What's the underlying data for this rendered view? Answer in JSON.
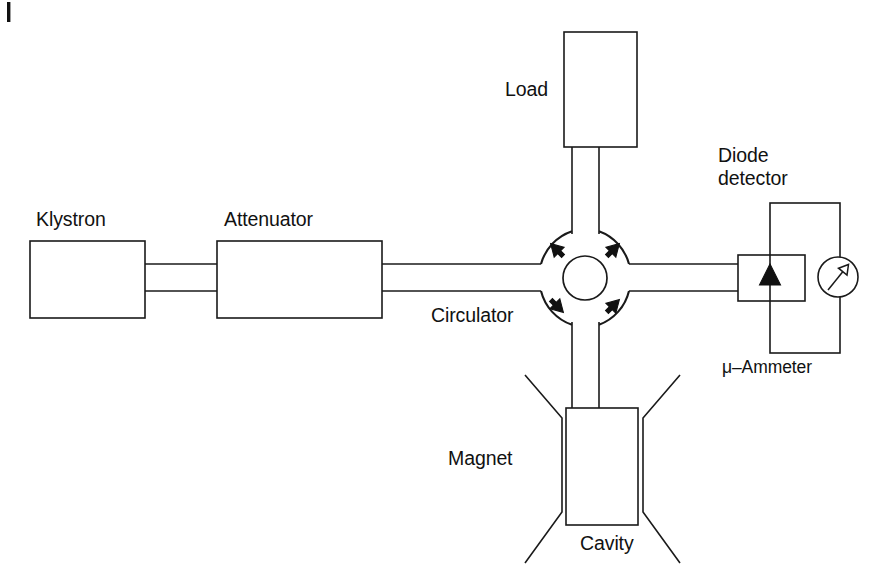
{
  "figure": {
    "domain": "Diagram",
    "background_color": "#ffffff",
    "line_color": "#1a1a1a",
    "width": 892,
    "height": 585
  },
  "labels": {
    "klystron": "Klystron",
    "attenuator": "Attenuator",
    "load": "Load",
    "circulator": "Circulator",
    "diode_detector_line1": "Diode",
    "diode_detector_line2": "detector",
    "micro_ammeter": "μ–Ammeter",
    "magnet": "Magnet",
    "cavity": "Cavity"
  },
  "components": [
    {
      "id": "klystron",
      "name": "Klystron",
      "shape": "rectangle",
      "x": 30,
      "y": 241,
      "width": 115,
      "height": 77,
      "label_position": "above"
    },
    {
      "id": "attenuator",
      "name": "Attenuator",
      "shape": "rectangle",
      "x": 217,
      "y": 241,
      "width": 165,
      "height": 77,
      "label_position": "above"
    },
    {
      "id": "load",
      "name": "Load",
      "shape": "rectangle",
      "x": 564,
      "y": 32,
      "width": 73,
      "height": 115,
      "label_position": "left"
    },
    {
      "id": "circulator",
      "name": "Circulator",
      "shape": "circulator",
      "center_x": 585,
      "center_y": 278,
      "outer_radius": 48,
      "inner_radius": 22,
      "port_count": 4,
      "rotation_sense": "counter-clockwise",
      "label_position": "lower-left"
    },
    {
      "id": "diode-detector",
      "name": "Diode detector",
      "shape": "rectangle-with-diode-triangle",
      "x": 738,
      "y": 255,
      "width": 67,
      "height": 46,
      "label_position": "above"
    },
    {
      "id": "micro-ammeter",
      "name": "μ–Ammeter",
      "shape": "circle-with-needle",
      "center_x": 838,
      "center_y": 277,
      "radius": 20,
      "label_position": "below"
    },
    {
      "id": "cavity",
      "name": "Cavity",
      "shape": "rectangle",
      "x": 566,
      "y": 408,
      "width": 72,
      "height": 117,
      "label_position": "below"
    },
    {
      "id": "magnet",
      "name": "Magnet",
      "shape": "pole-pieces-pair",
      "left_pole_x": 525,
      "right_pole_x": 680,
      "top_y": 375,
      "bottom_y": 563,
      "label_position": "left"
    }
  ],
  "connections": [
    {
      "id": "klystron-attenuator",
      "from": "klystron",
      "to": "attenuator",
      "type": "waveguide",
      "orientation": "horizontal"
    },
    {
      "id": "attenuator-circulator",
      "from": "attenuator",
      "to": "circulator",
      "type": "waveguide",
      "orientation": "horizontal"
    },
    {
      "id": "circulator-load",
      "from": "circulator",
      "to": "load",
      "type": "waveguide",
      "orientation": "vertical"
    },
    {
      "id": "circulator-diode",
      "from": "circulator",
      "to": "diode-detector",
      "type": "waveguide",
      "orientation": "horizontal"
    },
    {
      "id": "circulator-cavity",
      "from": "circulator",
      "to": "cavity",
      "type": "waveguide",
      "orientation": "vertical"
    },
    {
      "id": "diode-ammeter-loop",
      "from": "diode-detector",
      "to": "micro-ammeter",
      "type": "electrical-loop",
      "orientation": "rectangular"
    }
  ],
  "circulator_arrows": [
    {
      "id": "arrow-top-left",
      "direction": "down-left",
      "glyph": "↙"
    },
    {
      "id": "arrow-top-right",
      "direction": "up-right",
      "glyph": "↗"
    },
    {
      "id": "arrow-bottom-left",
      "direction": "down-right",
      "glyph": "↘"
    },
    {
      "id": "arrow-bottom-right",
      "direction": "up-right",
      "glyph": "↗"
    }
  ]
}
